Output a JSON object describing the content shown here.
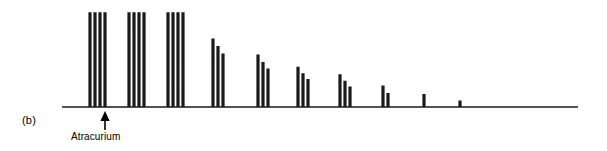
{
  "figure": {
    "panel_label": "(b)",
    "drug_label": "Atracurium",
    "stroke_color": "#1a1a1a",
    "background_color": "#ffffff",
    "arrow_color": "#000000"
  },
  "chart_data": {
    "type": "line",
    "title": "",
    "subtitle": "",
    "xlabel": "",
    "ylabel": "",
    "annotations": [
      {
        "text": "Atracurium",
        "x": 105,
        "y": 107,
        "marker": "up-arrow",
        "meaning": "time of atracurium injection"
      },
      {
        "text": "(b)",
        "x": 22,
        "y": 120,
        "marker": "none",
        "meaning": "panel identifier"
      }
    ],
    "baseline_y": 107,
    "trace_start_x": 62,
    "trace_end_x": 578,
    "full_twitch_height": 94,
    "axis_ranges": {
      "x": [
        62,
        578
      ],
      "y": [
        0,
        100
      ]
    },
    "grid": false,
    "legend": null,
    "stimulus_pattern": "train-of-four",
    "groups": [
      {
        "index": 1,
        "label": "TOF 1",
        "x_start": 90,
        "spacing": 5,
        "amplitudes": [
          100,
          100,
          100,
          100
        ],
        "tof_ratio": 1.0
      },
      {
        "index": 2,
        "label": "TOF 2",
        "x_start": 129,
        "spacing": 5,
        "amplitudes": [
          100,
          100,
          100,
          100
        ],
        "tof_ratio": 1.0
      },
      {
        "index": 3,
        "label": "TOF 3",
        "x_start": 168,
        "spacing": 5,
        "amplitudes": [
          100,
          100,
          100,
          100
        ],
        "tof_ratio": 1.0
      },
      {
        "index": 4,
        "label": "TOF 4",
        "x_start": 213,
        "spacing": 5,
        "amplitudes": [
          72,
          64,
          56,
          0
        ],
        "tof_ratio": 0.0
      },
      {
        "index": 5,
        "label": "TOF 5",
        "x_start": 258,
        "spacing": 5,
        "amplitudes": [
          55,
          47,
          40,
          0
        ],
        "tof_ratio": 0.0
      },
      {
        "index": 6,
        "label": "TOF 6",
        "x_start": 298,
        "spacing": 5,
        "amplitudes": [
          42,
          35,
          29,
          0
        ],
        "tof_ratio": 0.0
      },
      {
        "index": 7,
        "label": "TOF 7",
        "x_start": 340,
        "spacing": 5,
        "amplitudes": [
          34,
          27,
          21,
          0
        ],
        "tof_ratio": 0.0
      },
      {
        "index": 8,
        "label": "TOF 8",
        "x_start": 383,
        "spacing": 5,
        "amplitudes": [
          22,
          14,
          0,
          0
        ],
        "tof_ratio": 0.0
      },
      {
        "index": 9,
        "label": "TOF 9",
        "x_start": 424,
        "spacing": 5,
        "amplitudes": [
          13,
          0,
          0,
          0
        ],
        "tof_ratio": 0.0
      },
      {
        "index": 10,
        "label": "TOF 10",
        "x_start": 460,
        "spacing": 5,
        "amplitudes": [
          6,
          0,
          0,
          0
        ],
        "tof_ratio": 0.0
      },
      {
        "index": 11,
        "label": "TOF 11",
        "x_start": 495,
        "spacing": 5,
        "amplitudes": [
          0,
          0,
          0,
          0
        ],
        "tof_ratio": 0.0
      }
    ]
  }
}
